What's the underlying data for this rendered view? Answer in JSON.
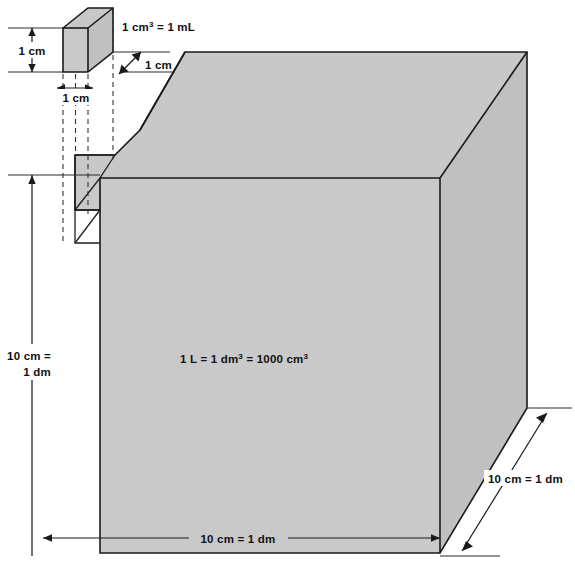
{
  "figure": {
    "background_color": "#ffffff",
    "fill_color": "#c9c9c9",
    "edge_color": "#1a1a1a"
  },
  "labels": {
    "small_cube_height": "1 cm",
    "small_cube_width": "1 cm",
    "small_cube_depth": "1 cm",
    "small_cube_equivalence_pre": "1 cm",
    "small_cube_equivalence_sup": "3",
    "small_cube_equivalence_post": " = 1 mL",
    "large_cube_height_line1": "10 cm =",
    "large_cube_height_line2": "1 dm",
    "large_cube_width": "10 cm = 1 dm",
    "large_cube_depth": "10 cm = 1 dm",
    "center_pre": "1 L = 1 dm",
    "center_sup1": "3",
    "center_mid": " = 1000 cm",
    "center_sup2": "3"
  }
}
